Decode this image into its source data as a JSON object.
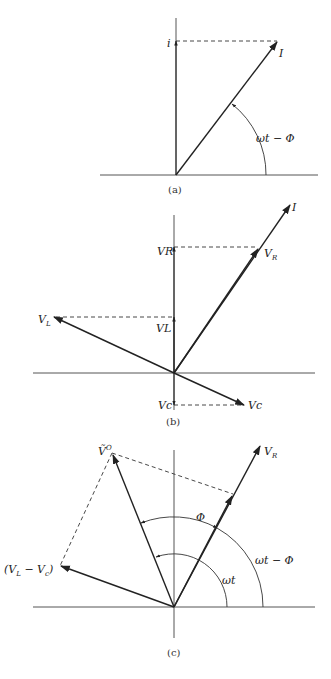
{
  "panels": {
    "a": {
      "caption": "(a)",
      "labels": {
        "projection": "i",
        "vector": "I",
        "angle": "ωt − Φ"
      }
    },
    "b": {
      "caption": "(b)",
      "labels": {
        "vector_I": "I",
        "vr_proj": "VR",
        "vr_vec_base": "V",
        "vr_vec_sub": "R",
        "vl_vec_base": "V",
        "vl_vec_sub": "L",
        "vl_proj": "VL",
        "vc_proj": "Vc",
        "vc_vec": "Vc"
      }
    },
    "c": {
      "caption": "(c)",
      "labels": {
        "vo_base": "Ṽ",
        "vo_sup": "O",
        "vr_base": "V",
        "vr_sub": "R",
        "diff_open": "(V",
        "diff_sub_l": "L",
        "diff_mid": " − V",
        "diff_sub_c": "c",
        "diff_close": ")",
        "phi": "Φ",
        "wt": "ωt",
        "wt_minus_phi": "ωt − Φ"
      }
    }
  }
}
